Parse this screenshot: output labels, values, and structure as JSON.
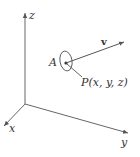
{
  "diagram": {
    "type": "3d-coordinate-axes",
    "axes": {
      "z": {
        "label": "z"
      },
      "x": {
        "label": "x"
      },
      "y": {
        "label": "y"
      }
    },
    "region": {
      "label": "A"
    },
    "point": {
      "label": "P(x, y, z)"
    },
    "vector": {
      "label": "v"
    },
    "colors": {
      "stroke": "#555555",
      "text": "#333333"
    }
  }
}
